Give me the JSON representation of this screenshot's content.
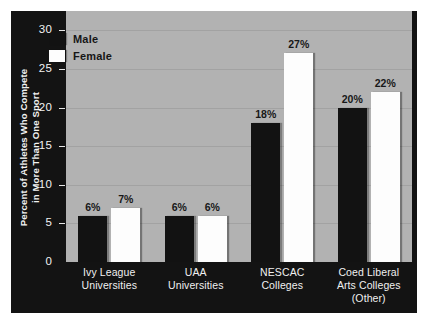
{
  "chart_data": {
    "type": "bar",
    "title": "",
    "xlabel": "",
    "ylabel": "Percent of Athletes Who Compete in More Than One Sport",
    "ylabel_lines": [
      "Percent of Athletes Who Compete",
      "in More Than One Sport"
    ],
    "categories": [
      "Ivy League Universities",
      "UAA Universities",
      "NESCAC Colleges",
      "Coed Liberal Arts Colleges (Other)"
    ],
    "category_lines": [
      [
        "Ivy League",
        "Universities"
      ],
      [
        "UAA",
        "Universities"
      ],
      [
        "NESCAC",
        "Colleges"
      ],
      [
        "Coed Liberal",
        "Arts Colleges",
        "(Other)"
      ]
    ],
    "series": [
      {
        "name": "Male",
        "values": [
          6,
          6,
          18,
          20
        ],
        "labels": [
          "6%",
          "6%",
          "18%",
          "20%"
        ],
        "color": "#121212"
      },
      {
        "name": "Female",
        "values": [
          7,
          6,
          27,
          22
        ],
        "labels": [
          "7%",
          "6%",
          "27%",
          "22%"
        ],
        "color": "#fdfdfd"
      }
    ],
    "ylim": [
      0,
      32.5
    ],
    "yticks": [
      0,
      5,
      10,
      15,
      20,
      25,
      30
    ],
    "ytick_labels": [
      "0",
      "5",
      "10",
      "15",
      "20",
      "25",
      "30"
    ],
    "grid": true,
    "legend_position": "upper-left-inside"
  },
  "legend": {
    "entries": [
      {
        "label": "Male",
        "swatch": "black-square-swatch"
      },
      {
        "label": "Female",
        "swatch": "white-square-swatch"
      }
    ]
  },
  "colors": {
    "canvas": "#ffffff",
    "panel": "#131313",
    "plot_background": "#b2b2b2",
    "gridline": "#a2a2a2",
    "male_bar": "#121212",
    "female_bar": "#fdfdfd",
    "axis_text": "#f2f2f2",
    "value_text": "#181818"
  }
}
